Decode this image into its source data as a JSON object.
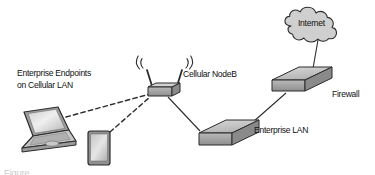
{
  "diagram": {
    "background_color": "#ffffff",
    "stroke_color": "#2b2b2b",
    "fill_light": "#d8d8d8",
    "fill_mid": "#b8b8b8",
    "fill_dark": "#9a9a9a",
    "labels": {
      "endpoints_line1": "Enterprise Endpoints",
      "endpoints_line2": "on Cellular LAN",
      "nodeb": "Cellular NodeB",
      "firewall": "Firewall",
      "enterprise_lan": "Enterprise LAN",
      "internet": "Internet"
    },
    "caption_partial": "Figure",
    "nodes": [
      {
        "id": "laptop",
        "name": "laptop",
        "label": "Enterprise Endpoints on Cellular LAN",
        "type": "endpoint-device"
      },
      {
        "id": "tablet",
        "name": "tablet",
        "label": "Enterprise Endpoints on Cellular LAN",
        "type": "endpoint-device"
      },
      {
        "id": "nodeb",
        "name": "cellular-nodeb",
        "label": "Cellular NodeB",
        "type": "wireless-access-point"
      },
      {
        "id": "lan",
        "name": "enterprise-lan",
        "label": "Enterprise LAN",
        "type": "switch"
      },
      {
        "id": "firewall",
        "name": "firewall",
        "label": "Firewall",
        "type": "firewall"
      },
      {
        "id": "internet",
        "name": "internet-cloud",
        "label": "Internet",
        "type": "cloud"
      }
    ],
    "links": [
      {
        "from": "laptop",
        "to": "nodeb",
        "style": "dashed",
        "medium": "wireless"
      },
      {
        "from": "tablet",
        "to": "nodeb",
        "style": "dashed",
        "medium": "wireless"
      },
      {
        "from": "nodeb",
        "to": "lan",
        "style": "solid",
        "medium": "wired"
      },
      {
        "from": "lan",
        "to": "firewall",
        "style": "solid",
        "medium": "wired"
      },
      {
        "from": "firewall",
        "to": "internet",
        "style": "solid",
        "medium": "wired"
      }
    ]
  }
}
